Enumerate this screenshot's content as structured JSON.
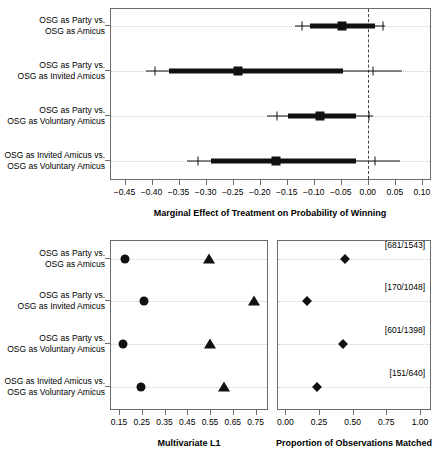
{
  "figure": {
    "categories": [
      [
        "OSG as Party vs.",
        "OSG as Amicus"
      ],
      [
        "OSG as Party vs.",
        "OSG as Invited Amicus"
      ],
      [
        "OSG as Party vs.",
        "OSG as Voluntary Amicus"
      ],
      [
        "OSG as Invited Amicus vs.",
        "OSG as Voluntary Amicus"
      ]
    ]
  },
  "chart_data": [
    {
      "type": "scatter",
      "panel": "top",
      "title": "",
      "xlabel": "Marginal Effect of Treatment on Probability of Winning",
      "ylabel": "",
      "xlim": [
        -0.475,
        0.115
      ],
      "xticks": [
        -0.45,
        -0.4,
        -0.35,
        -0.3,
        -0.25,
        -0.2,
        -0.15,
        -0.1,
        -0.05,
        0.0,
        0.05,
        0.1
      ],
      "xticklabels": [
        "-0.45",
        "-0.40",
        "-0.35",
        "-0.30",
        "-0.25",
        "-0.20",
        "-0.15",
        "-0.10",
        "-0.05",
        "0.00",
        "0.05",
        "0.10"
      ],
      "grid": true,
      "zero_reference": 0.0,
      "categories": [
        "OSG as Party vs. OSG as Amicus",
        "OSG as Party vs. OSG as Invited Amicus",
        "OSG as Party vs. OSG as Voluntary Amicus",
        "OSG as Invited Amicus vs. OSG as Voluntary Amicus"
      ],
      "estimates": [
        -0.047,
        -0.241,
        -0.088,
        -0.17
      ],
      "inner_interval_low": [
        -0.107,
        -0.368,
        -0.147,
        -0.29
      ],
      "inner_interval_high": [
        0.013,
        -0.046,
        -0.022,
        -0.022
      ],
      "outer_interval_low": [
        -0.135,
        -0.41,
        -0.186,
        -0.335
      ],
      "outer_interval_high": [
        0.032,
        0.063,
        0.01,
        0.06
      ],
      "outer_tick_low": [
        -0.122,
        -0.394,
        -0.168,
        -0.314
      ],
      "outer_tick_high": [
        0.028,
        0.01,
        0.002,
        0.013
      ]
    },
    {
      "type": "scatter",
      "panel": "bottom-left",
      "title": "",
      "xlabel": "Multivariate L1",
      "ylabel": "",
      "xlim": [
        0.115,
        0.8
      ],
      "xticks": [
        0.15,
        0.25,
        0.35,
        0.45,
        0.55,
        0.65,
        0.75
      ],
      "xticklabels": [
        "0.15",
        "0.25",
        "0.35",
        "0.45",
        "0.55",
        "0.65",
        "0.75"
      ],
      "grid": true,
      "categories": [
        "OSG as Party vs. OSG as Amicus",
        "OSG as Party vs. OSG as Invited Amicus",
        "OSG as Party vs. OSG as Voluntary Amicus",
        "OSG as Invited Amicus vs. OSG as Voluntary Amicus"
      ],
      "series": [
        {
          "name": "matched",
          "marker": "circle",
          "values": [
            0.175,
            0.262,
            0.168,
            0.248
          ]
        },
        {
          "name": "unmatched",
          "marker": "triangle",
          "values": [
            0.547,
            0.742,
            0.548,
            0.61
          ]
        }
      ]
    },
    {
      "type": "scatter",
      "panel": "bottom-right",
      "title": "",
      "xlabel": "Proportion of Observations Matched",
      "ylabel": "",
      "xlim": [
        -0.055,
        1.075
      ],
      "xticks": [
        0.0,
        0.25,
        0.5,
        0.75,
        1.0
      ],
      "xticklabels": [
        "0.00",
        "0.25",
        "0.50",
        "0.75",
        "1.00"
      ],
      "grid": true,
      "categories": [
        "OSG as Party vs. OSG as Amicus",
        "OSG as Party vs. OSG as Invited Amicus",
        "OSG as Party vs. OSG as Voluntary Amicus",
        "OSG as Invited Amicus vs. OSG as Voluntary Amicus"
      ],
      "series": [
        {
          "name": "proportion",
          "marker": "diamond",
          "values": [
            0.441,
            0.162,
            0.43,
            0.236
          ]
        }
      ],
      "annotations": [
        "[681/1543]",
        "[170/1048]",
        "[601/1398]",
        "[151/640]"
      ]
    }
  ]
}
